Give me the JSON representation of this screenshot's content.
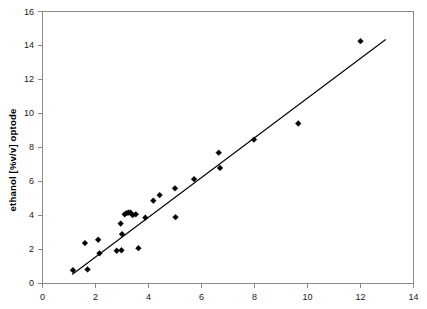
{
  "chart_data": {
    "type": "scatter",
    "title": "",
    "xlabel": "",
    "ylabel": "ethanol  [%v/v]  optode",
    "xlim": [
      0,
      14
    ],
    "ylim": [
      0,
      16
    ],
    "xticks": [
      0,
      2,
      4,
      6,
      8,
      10,
      12,
      14
    ],
    "yticks": [
      0,
      2,
      4,
      6,
      8,
      10,
      12,
      14,
      16
    ],
    "xtick_labels": [
      "0",
      "2",
      "4",
      "6",
      "8",
      "10",
      "12",
      "14"
    ],
    "ytick_labels": [
      "0",
      "2",
      "4",
      "6",
      "8",
      "10",
      "12",
      "14",
      "16"
    ],
    "grid": false,
    "legend": false,
    "marker": "diamond",
    "marker_color": "#000000",
    "series": [
      {
        "name": "ethanol optode vs reference",
        "points": [
          [
            1.15,
            0.75
          ],
          [
            1.6,
            2.35
          ],
          [
            1.7,
            0.8
          ],
          [
            2.1,
            2.55
          ],
          [
            2.15,
            1.75
          ],
          [
            2.8,
            1.9
          ],
          [
            2.95,
            3.5
          ],
          [
            2.98,
            1.93
          ],
          [
            3.0,
            2.88
          ],
          [
            3.1,
            4.05
          ],
          [
            3.18,
            4.12
          ],
          [
            3.25,
            4.15
          ],
          [
            3.32,
            4.15
          ],
          [
            3.4,
            4.0
          ],
          [
            3.52,
            4.05
          ],
          [
            3.62,
            2.05
          ],
          [
            3.88,
            3.85
          ],
          [
            4.18,
            4.85
          ],
          [
            4.42,
            5.18
          ],
          [
            5.0,
            5.58
          ],
          [
            5.02,
            3.88
          ],
          [
            5.72,
            6.12
          ],
          [
            6.65,
            7.68
          ],
          [
            6.7,
            6.78
          ],
          [
            7.98,
            8.45
          ],
          [
            9.65,
            9.4
          ],
          [
            12.0,
            14.25
          ]
        ]
      }
    ],
    "fit_line": {
      "name": "linear regression",
      "x_start": 1.12,
      "y_start": 0.5,
      "x_end": 12.95,
      "y_end": 14.35,
      "color": "#000000"
    }
  },
  "axes": {
    "y_axis_title": "ethanol  [%v/v]  optode"
  }
}
